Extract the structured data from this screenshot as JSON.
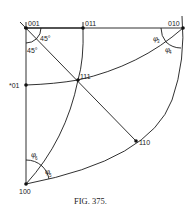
{
  "figure": {
    "caption": "FIG. 375.",
    "points": {
      "p001": "001",
      "p011": "011",
      "p010": "010",
      "p111": "111",
      "p101": "*01",
      "p110": "110",
      "p100": "100"
    },
    "angles": {
      "a45_top": "45°",
      "a45_left": "45°",
      "phi3": "φ",
      "phi3_sub": "3",
      "phi4": "φ",
      "phi4_sub": "4",
      "phi5": "φ",
      "phi5_sub": "5",
      "phi6": "φ",
      "phi6_sub": "6"
    }
  }
}
